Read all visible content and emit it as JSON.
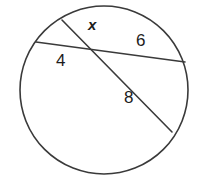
{
  "figure": {
    "kind": "circle-with-two-intersecting-chords",
    "background_color": "#ffffff",
    "stroke_color": "#3a3a3a",
    "text_color": "#1c1c1c",
    "stroke_width": 1.6,
    "circle": {
      "cx": 104,
      "cy": 90,
      "r": 84
    },
    "chords": [
      {
        "name": "chord-horizontal",
        "x1": 36,
        "y1": 42,
        "x2": 185,
        "y2": 62,
        "segments": [
          "4",
          "6"
        ]
      },
      {
        "name": "chord-diagonal",
        "x1": 62,
        "y1": 20,
        "x2": 172,
        "y2": 132,
        "segments": [
          "x",
          "8"
        ]
      }
    ],
    "intersection": {
      "x": 97,
      "y": 52
    },
    "labels": {
      "x": "x",
      "six": "6",
      "four": "4",
      "eight": "8"
    }
  }
}
